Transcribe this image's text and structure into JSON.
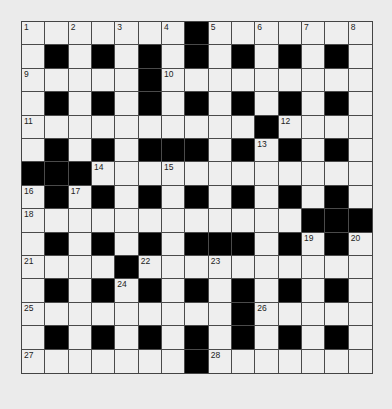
{
  "puzzle": {
    "rows": 15,
    "cols": 15,
    "colors": {
      "background": "#ebebeb",
      "white_cell": "#eeeeee",
      "black_cell": "#000000",
      "border": "#4a4a4a",
      "number": "#222222"
    },
    "grid": [
      ".......#.......",
      ".#.#.#.#.#.#.#.",
      ".....#.........",
      ".#.#.#.#.#.#.#.",
      "..........#....",
      ".#.#.###.#.#.#.",
      "###............",
      ".#.#.#.#.#.#.#.",
      "............###",
      ".#.#.#.###.#.#.",
      "....#..........",
      ".#.#.#.#.#.#.#.",
      ".........#.....",
      ".#.#.#.#.#.#.#.",
      ".......#......."
    ],
    "numbers": [
      {
        "row": 0,
        "col": 0,
        "n": "1"
      },
      {
        "row": 0,
        "col": 2,
        "n": "2"
      },
      {
        "row": 0,
        "col": 4,
        "n": "3"
      },
      {
        "row": 0,
        "col": 6,
        "n": "4"
      },
      {
        "row": 0,
        "col": 8,
        "n": "5"
      },
      {
        "row": 0,
        "col": 10,
        "n": "6"
      },
      {
        "row": 0,
        "col": 12,
        "n": "7"
      },
      {
        "row": 0,
        "col": 14,
        "n": "8"
      },
      {
        "row": 2,
        "col": 0,
        "n": "9"
      },
      {
        "row": 2,
        "col": 6,
        "n": "10"
      },
      {
        "row": 4,
        "col": 0,
        "n": "11"
      },
      {
        "row": 4,
        "col": 11,
        "n": "12"
      },
      {
        "row": 5,
        "col": 10,
        "n": "13"
      },
      {
        "row": 6,
        "col": 3,
        "n": "14"
      },
      {
        "row": 6,
        "col": 6,
        "n": "15"
      },
      {
        "row": 7,
        "col": 0,
        "n": "16"
      },
      {
        "row": 7,
        "col": 2,
        "n": "17"
      },
      {
        "row": 8,
        "col": 0,
        "n": "18"
      },
      {
        "row": 9,
        "col": 12,
        "n": "19"
      },
      {
        "row": 9,
        "col": 14,
        "n": "20"
      },
      {
        "row": 10,
        "col": 0,
        "n": "21"
      },
      {
        "row": 10,
        "col": 5,
        "n": "22"
      },
      {
        "row": 10,
        "col": 8,
        "n": "23"
      },
      {
        "row": 11,
        "col": 4,
        "n": "24"
      },
      {
        "row": 12,
        "col": 0,
        "n": "25"
      },
      {
        "row": 12,
        "col": 10,
        "n": "26"
      },
      {
        "row": 14,
        "col": 0,
        "n": "27"
      },
      {
        "row": 14,
        "col": 8,
        "n": "28"
      }
    ]
  }
}
